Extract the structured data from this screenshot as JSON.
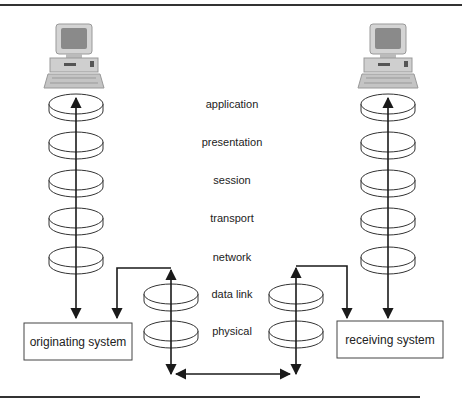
{
  "diagram": {
    "layers": [
      "application",
      "presentation",
      "session",
      "transport",
      "network",
      "data link",
      "physical"
    ],
    "left_system": {
      "label": "originating system",
      "stack_layers": 5
    },
    "right_system": {
      "label": "receiving system",
      "stack_layers": 5
    },
    "intermediate_left": {
      "stack_layers": 2
    },
    "intermediate_right": {
      "stack_layers": 2
    },
    "colors": {
      "line": "#1a1a1a",
      "disk_stroke": "#333333",
      "box_stroke": "#444444",
      "monitor_screen": "#8a8a8a",
      "computer_body": "#cfcfcf"
    },
    "icons": {
      "left_computer": "desktop-computer-icon",
      "right_computer": "desktop-computer-icon"
    }
  }
}
